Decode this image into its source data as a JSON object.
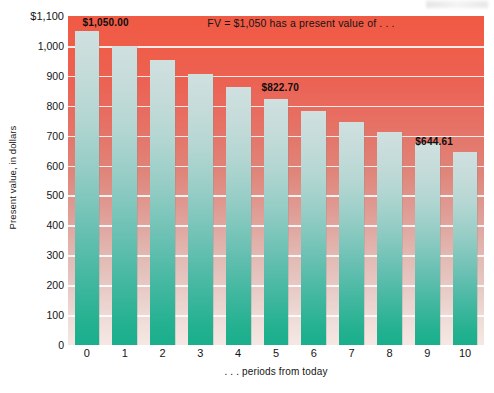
{
  "chart_data": {
    "type": "bar",
    "title": "",
    "subtitle": "",
    "xlabel": ". . . periods from today",
    "ylabel": "Present value, in dollars",
    "categories": [
      "0",
      "1",
      "2",
      "3",
      "4",
      "5",
      "6",
      "7",
      "8",
      "9",
      "10"
    ],
    "values": [
      1050.0,
      1000.0,
      952.38,
      907.03,
      863.84,
      822.7,
      783.53,
      746.22,
      710.68,
      676.84,
      644.61
    ],
    "series": [
      {
        "name": "Present value of $1,050",
        "values": [
          1050.0,
          1000.0,
          952.38,
          907.03,
          863.84,
          822.7,
          783.53,
          746.22,
          710.68,
          676.84,
          644.61
        ]
      }
    ],
    "ylim": [
      0,
      1100
    ],
    "xlim_categories": 11,
    "y_ticks": [
      0,
      100,
      200,
      300,
      400,
      500,
      600,
      700,
      800,
      900,
      1000,
      1100
    ],
    "y_tick_labels": [
      "0",
      "100",
      "200",
      "300",
      "400",
      "500",
      "600",
      "700",
      "800",
      "900",
      "1,000",
      "$1,100"
    ],
    "x_tick_labels": [
      "0",
      "1",
      "2",
      "3",
      "4",
      "5",
      "6",
      "7",
      "8",
      "9",
      "10"
    ],
    "grid": true,
    "grid_axis": "y",
    "legend": false,
    "legend_position": "none",
    "bar_color_top": "#cfe0df",
    "bar_color_bottom": "#1aaf8c",
    "background_color_top": "#f05a45",
    "background_color_bottom": "#f5e8e4",
    "gridline_color": "#ffffff",
    "annotations": [
      {
        "text": "FV = $1,050 has a present value of . . .",
        "category": "",
        "kind": "caption",
        "x_frac": 0.335,
        "y_value": 1075
      },
      {
        "text": "$1,050.00",
        "category": "0",
        "kind": "data-label",
        "value": 1050.0,
        "x_frac": 0.035,
        "y_value": 1075
      },
      {
        "text": "$822.70",
        "category": "5",
        "kind": "data-label",
        "value": 822.7,
        "x_frac": 0.465,
        "y_value": 860
      },
      {
        "text": "$644.61",
        "category": "10",
        "kind": "data-label",
        "value": 644.61,
        "x_frac": 0.835,
        "y_value": 680
      }
    ]
  }
}
